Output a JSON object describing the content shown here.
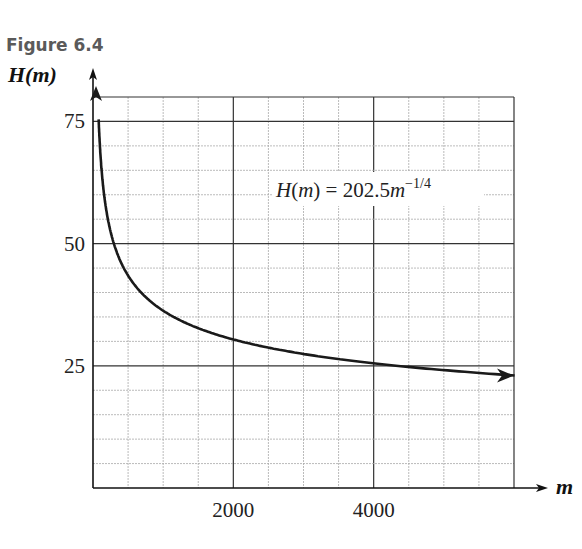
{
  "figure_label": "Figure 6.4",
  "chart_data": {
    "type": "line",
    "title": "Figure 6.4",
    "xlabel": "m",
    "ylabel": "H(m)",
    "annotation": "H(m) = 202.5m^(-1/4)",
    "equation": {
      "lhs": "H(m) = 202.5",
      "var": "m",
      "exp": "−1/4"
    },
    "xlim": [
      0,
      6000
    ],
    "ylim": [
      0,
      80
    ],
    "x_ticks": [
      2000,
      4000
    ],
    "x_tick_labels": [
      "2000",
      "4000"
    ],
    "y_ticks": [
      25,
      50,
      75
    ],
    "y_tick_labels": [
      "25",
      "50",
      "75"
    ],
    "grid": true,
    "minor_grid_x_step": 500,
    "minor_grid_y_step": 5,
    "series": [
      {
        "name": "H(m) = 202.5m^(-1/4)",
        "x": [
          50,
          100,
          200,
          500,
          1000,
          2000,
          3000,
          4000,
          5000,
          6000
        ],
        "values": [
          76.2,
          64.0,
          53.9,
          42.8,
          36.0,
          30.3,
          27.4,
          25.5,
          24.1,
          23.0
        ]
      }
    ]
  }
}
